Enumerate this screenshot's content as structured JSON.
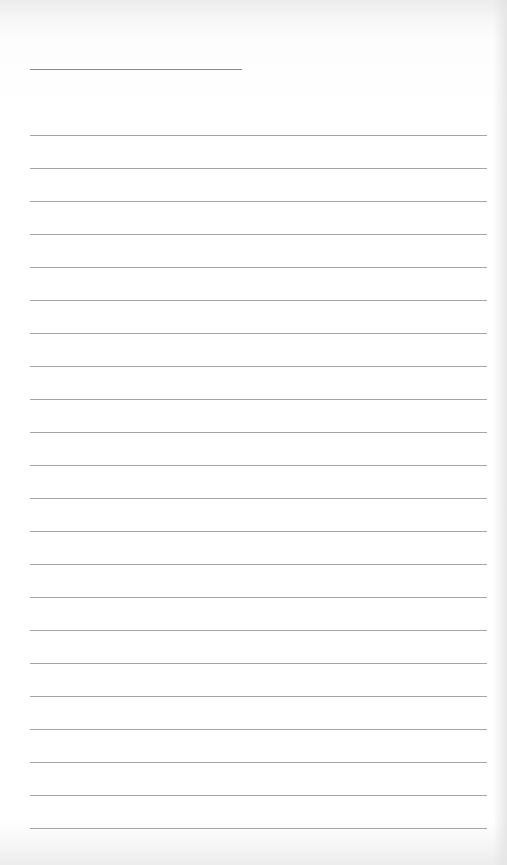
{
  "page": {
    "type": "lined-paper",
    "background_color": "#ffffff",
    "line_color": "#a5a5a5",
    "title_line": {
      "present": true
    },
    "ruled_line_count": 22
  }
}
